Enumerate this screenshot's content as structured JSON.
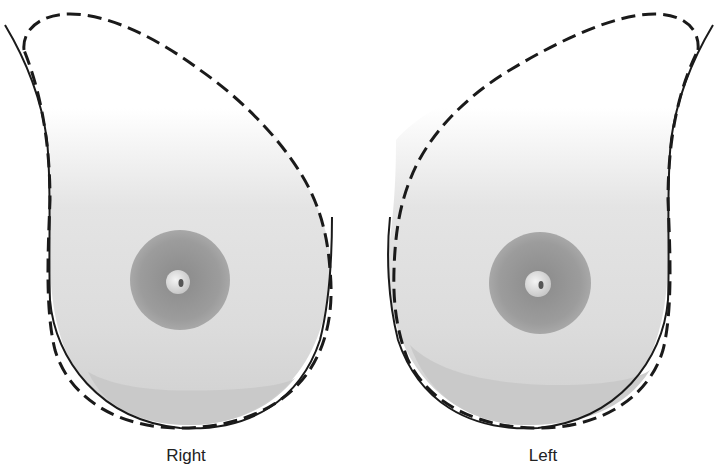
{
  "diagram": {
    "breasts": [
      {
        "id": "right",
        "label": "Right"
      },
      {
        "id": "left",
        "label": "Left"
      }
    ],
    "colors": {
      "outline": "#1a1a1a",
      "skin_light": "#f2f2f2",
      "skin_shade": "#d2d2d2",
      "areola": "#9a9a9a",
      "nipple": "#e6e6e6",
      "background": "#ffffff"
    },
    "line_styles": {
      "dashed": "tail outline",
      "solid": "breast contour"
    }
  }
}
